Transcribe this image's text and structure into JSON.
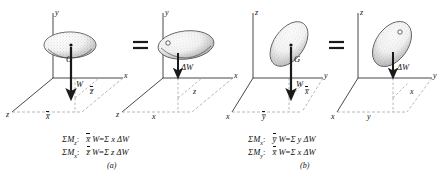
{
  "figure": {
    "title": "",
    "background": "#ffffff",
    "ink": "#1a1a1a",
    "panels": [
      {
        "id": "a-left",
        "group": "a",
        "side": "left",
        "axes": {
          "up": "y",
          "right": "x",
          "front": "z"
        },
        "body_label": "G",
        "force_label": "W",
        "dim_labels": [
          "x̅",
          "z̅"
        ],
        "has_cg_dot": true
      },
      {
        "id": "a-right",
        "group": "a",
        "side": "right",
        "axes": {
          "up": "y",
          "right": "x",
          "front": "z"
        },
        "body_label": "",
        "force_label": "ΔW",
        "dim_labels": [
          "x",
          "z"
        ],
        "has_cg_dot": false
      },
      {
        "id": "b-left",
        "group": "b",
        "side": "left",
        "axes": {
          "up": "z",
          "right": "y",
          "front": "x"
        },
        "body_label": "G",
        "force_label": "W",
        "dim_labels": [
          "y̅",
          "x̅"
        ],
        "has_cg_dot": true
      },
      {
        "id": "b-right",
        "group": "b",
        "side": "right",
        "axes": {
          "up": "z",
          "right": "y",
          "front": "x"
        },
        "body_label": "",
        "force_label": "ΔW",
        "dim_labels": [
          "y",
          "x"
        ],
        "has_cg_dot": false
      }
    ],
    "equals_signs": [
      "=",
      "="
    ],
    "equations": {
      "a": {
        "caption": "(a)",
        "rows": [
          {
            "moment": "ΣM",
            "moment_sub": "z",
            "colon": ":",
            "lhs_var": "x̅",
            "lhs_rest": "W",
            "eq": "=",
            "rhs": "Σ x ΔW"
          },
          {
            "moment": "ΣM",
            "moment_sub": "x",
            "colon": ":",
            "lhs_var": "z̅",
            "lhs_rest": "W",
            "eq": "=",
            "rhs": "Σ z ΔW"
          }
        ]
      },
      "b": {
        "caption": "(b)",
        "rows": [
          {
            "moment": "ΣM",
            "moment_sub": "x",
            "colon": ":",
            "lhs_var": "y̅",
            "lhs_rest": "W",
            "eq": "=",
            "rhs": "Σ y ΔW"
          },
          {
            "moment": "ΣM",
            "moment_sub": "y",
            "colon": ":",
            "lhs_var": "x̅",
            "lhs_rest": "W",
            "eq": "=",
            "rhs": "Σ x ΔW"
          }
        ]
      }
    }
  }
}
